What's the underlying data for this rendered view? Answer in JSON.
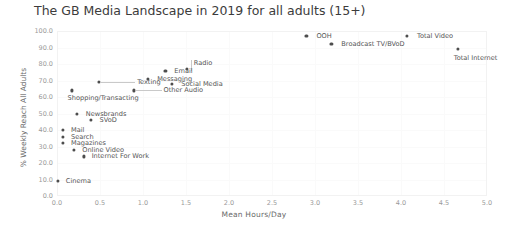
{
  "chart_data": {
    "type": "scatter",
    "title": "The GB Media Landscape in 2019 for all adults (15+)",
    "xlabel": "Mean Hours/Day",
    "ylabel": "% Weekly Reach All Adults",
    "xlim": [
      0.0,
      5.0
    ],
    "ylim": [
      0.0,
      100.0
    ],
    "xticks": [
      "0.0",
      "0.5",
      "1.0",
      "1.5",
      "2.0",
      "2.5",
      "3.0",
      "3.5",
      "4.0",
      "4.5",
      "5.0"
    ],
    "yticks": [
      "0.0",
      "10.0",
      "20.0",
      "30.0",
      "40.0",
      "50.0",
      "60.0",
      "70.0",
      "80.0",
      "90.0",
      "100.0"
    ],
    "grid": true,
    "legend": "none",
    "marker_color": "#4d4d4d",
    "points": [
      {
        "label": "OOH",
        "x": 2.9,
        "y": 97.0,
        "lx": 10,
        "ly": -3
      },
      {
        "label": "Total Video",
        "x": 4.07,
        "y": 97.0,
        "lx": 10,
        "ly": -3
      },
      {
        "label": "Broadcast TV/BVoD",
        "x": 3.19,
        "y": 92.0,
        "lx": 10,
        "ly": -3
      },
      {
        "label": "Total Internet",
        "x": 4.66,
        "y": 89.0,
        "lx": -4,
        "ly": 6
      },
      {
        "label": "Radio",
        "x": 1.51,
        "y": 77.0,
        "lx": 7,
        "ly": -9,
        "leader": "v"
      },
      {
        "label": "Email",
        "x": 1.26,
        "y": 76.0,
        "lx": 9,
        "ly": -3
      },
      {
        "label": "Messaging",
        "x": 1.06,
        "y": 71.0,
        "lx": 9,
        "ly": -3
      },
      {
        "label": "Social Media",
        "x": 1.34,
        "y": 68.0,
        "lx": 9,
        "ly": -3
      },
      {
        "label": "Texting",
        "x": 0.49,
        "y": 69.0,
        "lx": 38,
        "ly": -3,
        "leader": "h"
      },
      {
        "label": "Other Audio",
        "x": 0.89,
        "y": 64.0,
        "lx": 30,
        "ly": -3,
        "leader": "h"
      },
      {
        "label": "Shopping/Transacting",
        "x": 0.17,
        "y": 64.0,
        "lx": -4,
        "ly": 5
      },
      {
        "label": "Newsbrands",
        "x": 0.23,
        "y": 50.0,
        "lx": 9,
        "ly": -3
      },
      {
        "label": "SVoD",
        "x": 0.39,
        "y": 46.0,
        "lx": 9,
        "ly": -3
      },
      {
        "label": "Mail",
        "x": 0.07,
        "y": 40.0,
        "lx": 8,
        "ly": -3
      },
      {
        "label": "Search",
        "x": 0.07,
        "y": 36.0,
        "lx": 8,
        "ly": -3
      },
      {
        "label": "Magazines",
        "x": 0.07,
        "y": 32.0,
        "lx": 8,
        "ly": -3
      },
      {
        "label": "Online Video",
        "x": 0.2,
        "y": 28.0,
        "lx": 8,
        "ly": -3
      },
      {
        "label": "Internet For Work",
        "x": 0.31,
        "y": 24.0,
        "lx": 8,
        "ly": -3
      },
      {
        "label": "Cinema",
        "x": 0.01,
        "y": 9.0,
        "lx": 8,
        "ly": -3
      }
    ]
  }
}
